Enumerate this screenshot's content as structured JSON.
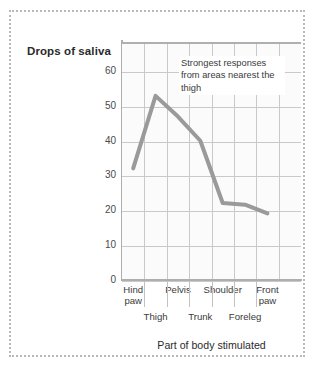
{
  "figure": {
    "y_axis_title": "Drops of saliva",
    "x_axis_title": "Part of body stimulated",
    "annotation": "Strongest responses from areas nearest the thigh"
  },
  "chart_data": {
    "type": "line",
    "title": "",
    "subtitle": "",
    "xlabel": "Part of body stimulated",
    "ylabel": "Drops of saliva",
    "ylim": [
      0,
      68
    ],
    "yticks": [
      0,
      10,
      20,
      30,
      40,
      50,
      60
    ],
    "ytick_labels": [
      "0",
      "10",
      "20",
      "30",
      "40",
      "50",
      "60"
    ],
    "grid": true,
    "legend": "none",
    "line_color": "#9a9a9a",
    "line_width": 4,
    "categories": [
      "Hind paw",
      "Thigh",
      "Pelvis",
      "Trunk",
      "Shoulder",
      "Foreleg",
      "Front paw"
    ],
    "category_rows": [
      1,
      2,
      1,
      2,
      1,
      2,
      1
    ],
    "x": [
      0.5,
      1.5,
      2.5,
      3.5,
      4.5,
      5.5,
      6.5
    ],
    "values": [
      32,
      53,
      47,
      40,
      22,
      21.5,
      19
    ],
    "annotations": [
      {
        "text": "Strongest responses from areas nearest the thigh",
        "x": 2.4,
        "y": 62
      }
    ]
  }
}
